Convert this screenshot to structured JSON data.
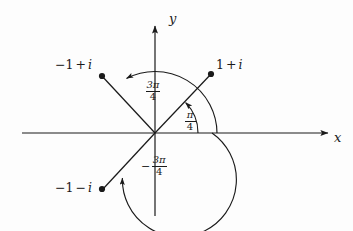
{
  "figure": {
    "type": "argand-diagram",
    "background_color": "#fdfdfd",
    "ink_color": "#1a1a1a",
    "axes": {
      "x_label": "x",
      "y_label": "y",
      "origin_px": [
        155,
        133
      ],
      "x_axis_px": [
        22,
        133,
        330,
        133
      ],
      "y_axis_px": [
        155,
        24,
        155,
        216
      ]
    },
    "points": [
      {
        "id": "one-plus-i",
        "label": "1 + i",
        "label_parts": {
          "real": "1",
          "op": "+",
          "imag": "i"
        },
        "dot_px": [
          211,
          74
        ],
        "label_px": [
          216,
          60
        ],
        "ray_from_px": [
          155,
          133
        ],
        "ray_to_px": [
          211,
          74
        ],
        "argument_label": "pi/4"
      },
      {
        "id": "minus-one-plus-i",
        "label": "-1 + i",
        "label_parts": {
          "real": "−1",
          "op": "+",
          "imag": "i"
        },
        "dot_px": [
          102,
          76
        ],
        "label_px": [
          56,
          62
        ],
        "ray_from_px": [
          155,
          133
        ],
        "ray_to_px": [
          102,
          76
        ],
        "argument_label": "3pi/4"
      },
      {
        "id": "minus-one-minus-i",
        "label": "-1 - i",
        "label_parts": {
          "real": "−1",
          "op": "−",
          "imag": "i"
        },
        "dot_px": [
          102,
          189
        ],
        "label_px": [
          56,
          182
        ],
        "ray_from_px": [
          155,
          133
        ],
        "ray_to_px": [
          102,
          189
        ],
        "argument_label": "-3pi/4"
      }
    ],
    "angle_arcs": [
      {
        "id": "arc-pi-over-4",
        "numerator": "π",
        "denominator": "4",
        "sign": "",
        "radius_px": 43,
        "start_deg": 0,
        "end_deg": 45,
        "direction": "counterclockwise",
        "label_px": [
          184,
          110
        ]
      },
      {
        "id": "arc-3pi-over-4",
        "numerator": "3π",
        "denominator": "4",
        "sign": "",
        "radius_px": 62,
        "start_deg": 0,
        "end_deg": 135,
        "direction": "counterclockwise",
        "label_px": [
          145,
          80
        ]
      },
      {
        "id": "arc-minus-3pi-over-4",
        "numerator": "3π",
        "denominator": "4",
        "sign": "−",
        "radius_px": 57,
        "start_deg": 0,
        "end_deg": -225,
        "direction": "clockwise",
        "label_px": [
          144,
          155
        ]
      }
    ]
  }
}
